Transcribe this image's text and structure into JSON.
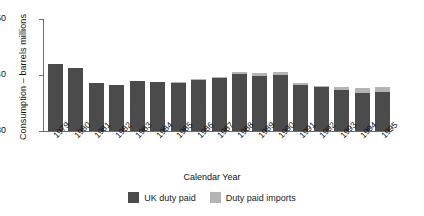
{
  "chart_data": {
    "type": "bar",
    "stacked": true,
    "title": "",
    "xlabel": "Calendar Year",
    "ylabel": "Consumption – barrels millions",
    "categories": [
      "1979",
      "1980",
      "1981",
      "1982",
      "1983",
      "1984",
      "1985",
      "1986",
      "1987",
      "1988",
      "1989",
      "1990",
      "1991",
      "1992",
      "1993",
      "1994",
      "1995"
    ],
    "series": [
      {
        "name": "UK duty paid",
        "color": "#4b4b4b",
        "values": [
          41.9,
          41.2,
          38.6,
          38.3,
          38.9,
          38.8,
          38.6,
          39.1,
          39.4,
          40.2,
          39.9,
          40.0,
          38.2,
          37.8,
          37.4,
          36.8,
          36.9
        ]
      },
      {
        "name": "Duty paid imports",
        "color": "#b4b4b4",
        "values": [
          0.0,
          0.0,
          0.0,
          0.0,
          0.0,
          0.0,
          0.1,
          0.2,
          0.3,
          0.3,
          0.4,
          0.5,
          0.3,
          0.3,
          0.5,
          0.9,
          1.0
        ]
      }
    ],
    "ylim": [
      30,
      50
    ],
    "yticks": [
      30,
      40,
      50
    ],
    "ytick_labels": [
      "30",
      "40",
      "50"
    ],
    "grid": false,
    "legend_position": "bottom"
  },
  "axes": {
    "y_title": "Consumption – barrels millions",
    "x_title": "Calendar Year"
  },
  "legend": {
    "items": [
      {
        "label": "UK duty paid",
        "color": "#4b4b4b"
      },
      {
        "label": "Duty paid imports",
        "color": "#b4b4b4"
      }
    ]
  }
}
